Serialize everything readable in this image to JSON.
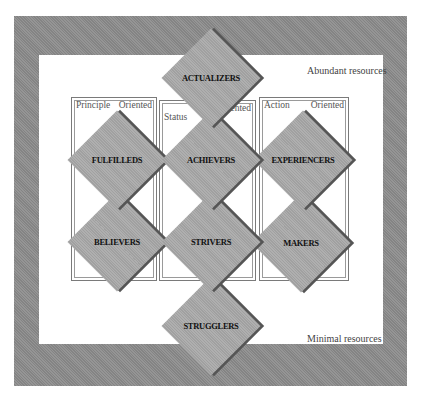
{
  "diagram": {
    "type": "segmentation-framework",
    "resource_axis": {
      "top_label": "Abundant resources",
      "bottom_label": "Minimal resources"
    },
    "columns": [
      {
        "left_label": "Principle",
        "right_label": "Oriented"
      },
      {
        "left_label": "Status",
        "right_label": "Oriented"
      },
      {
        "left_label": "Action",
        "right_label": "Oriented"
      }
    ],
    "segments": [
      {
        "id": "actualizers",
        "label": "ACTUALIZERS",
        "row": 0,
        "column": 1
      },
      {
        "id": "fulfilleds",
        "label": "FULFILLEDS",
        "row": 1,
        "column": 0
      },
      {
        "id": "achievers",
        "label": "ACHIEVERS",
        "row": 1,
        "column": 1
      },
      {
        "id": "experiencers",
        "label": "EXPERIENCERS",
        "row": 1,
        "column": 2
      },
      {
        "id": "believers",
        "label": "BELIEVERS",
        "row": 2,
        "column": 0
      },
      {
        "id": "strivers",
        "label": "STRIVERS",
        "row": 2,
        "column": 1
      },
      {
        "id": "makers",
        "label": "MAKERS",
        "row": 2,
        "column": 2
      },
      {
        "id": "strugglers",
        "label": "STRUGGLERS",
        "row": 3,
        "column": 1
      }
    ],
    "colors": {
      "frame": "#8c8c8c",
      "diamond_fill": "#a9a9a9",
      "diamond_shadow": "#555555",
      "column_border": "#7a7a7a"
    }
  }
}
